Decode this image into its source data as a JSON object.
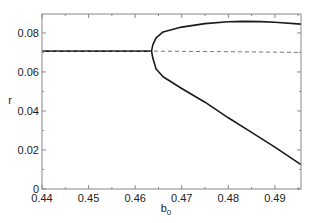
{
  "chart_data": {
    "type": "line",
    "title": "",
    "xlabel": "b",
    "xlabel_subscript": "0",
    "ylabel": "r",
    "xlim": [
      0.44,
      0.4956
    ],
    "ylim": [
      0,
      0.0897
    ],
    "grid": false,
    "legend": null,
    "x_ticks": [
      0.44,
      0.45,
      0.46,
      0.47,
      0.48,
      0.49
    ],
    "x_tick_labels": [
      "0.44",
      "0.45",
      "0.46",
      "0.47",
      "0.48",
      "0.49"
    ],
    "y_ticks": [
      0,
      0.02,
      0.04,
      0.06,
      0.08
    ],
    "y_tick_labels": [
      "0",
      "0.02",
      "0.04",
      "0.06",
      "0.08"
    ],
    "series": [
      {
        "name": "stable branch (before bifurcation)",
        "style": "solid",
        "x": [
          0.44,
          0.45,
          0.46,
          0.4635
        ],
        "y": [
          0.0707,
          0.0707,
          0.0707,
          0.0707
        ]
      },
      {
        "name": "upper branch",
        "style": "solid",
        "x": [
          0.4635,
          0.4638,
          0.4645,
          0.466,
          0.47,
          0.475,
          0.48,
          0.483,
          0.487,
          0.49,
          0.4956
        ],
        "y": [
          0.0707,
          0.074,
          0.0775,
          0.0805,
          0.083,
          0.0848,
          0.0857,
          0.0859,
          0.0858,
          0.0855,
          0.0845
        ]
      },
      {
        "name": "lower branch",
        "style": "solid",
        "x": [
          0.4635,
          0.4638,
          0.4645,
          0.466,
          0.47,
          0.475,
          0.48,
          0.485,
          0.49,
          0.4956
        ],
        "y": [
          0.0707,
          0.067,
          0.0615,
          0.0575,
          0.0515,
          0.0445,
          0.0365,
          0.029,
          0.0215,
          0.0125
        ]
      },
      {
        "name": "unstable branch",
        "style": "dashed",
        "x": [
          0.44,
          0.4635,
          0.48,
          0.4956
        ],
        "y": [
          0.0707,
          0.0707,
          0.0704,
          0.07
        ]
      }
    ]
  },
  "colors": {
    "axis": "#888888",
    "line": "#1a1a1a",
    "dashed": "#777777"
  }
}
